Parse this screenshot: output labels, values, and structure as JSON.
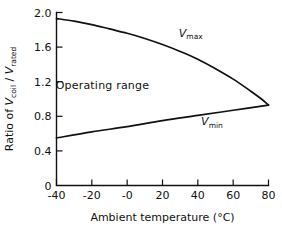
{
  "chart_data": {
    "type": "line",
    "title": "",
    "xlabel": "Ambient temperature (°C)",
    "ylabel": "Ratio of Vcoil / Vrated",
    "ylabel_parts": {
      "prefix": "Ratio of ",
      "num_var": "V",
      "num_sub": "coil",
      "separator": " / ",
      "den_var": "V",
      "den_sub": "rated"
    },
    "xlim": [
      -40,
      80
    ],
    "ylim": [
      0,
      2.0
    ],
    "xticks": [
      -40,
      -20,
      0,
      20,
      40,
      60,
      80
    ],
    "xtick_labels": [
      "-40",
      "-20",
      "-0",
      "20",
      "40",
      "60",
      "80"
    ],
    "yticks": [
      0,
      0.4,
      0.8,
      1.2,
      1.6,
      2.0
    ],
    "ytick_labels": [
      "0",
      "0.4",
      "0.8",
      "1.2",
      "1.6",
      "2.0"
    ],
    "grid": false,
    "legend": "none",
    "annotations": [
      {
        "text": "Operating range",
        "x": -14,
        "y": 1.12
      }
    ],
    "series": [
      {
        "name": "Vmax",
        "label_var": "V",
        "label_sub": "max",
        "label_x": 36,
        "label_y": 1.72,
        "x": [
          -40,
          -30,
          -20,
          -10,
          0,
          10,
          20,
          30,
          40,
          50,
          60,
          70,
          76,
          80
        ],
        "y": [
          1.93,
          1.9,
          1.86,
          1.81,
          1.76,
          1.7,
          1.63,
          1.55,
          1.46,
          1.35,
          1.23,
          1.09,
          1.0,
          0.93
        ]
      },
      {
        "name": "Vmin",
        "label_var": "V",
        "label_sub": "min",
        "label_x": 48,
        "label_y": 0.7,
        "x": [
          -40,
          -20,
          0,
          20,
          40,
          60,
          80
        ],
        "y": [
          0.55,
          0.62,
          0.68,
          0.75,
          0.81,
          0.87,
          0.93
        ]
      }
    ]
  },
  "colors": {
    "ink": "#111111",
    "background": "#ffffff"
  }
}
